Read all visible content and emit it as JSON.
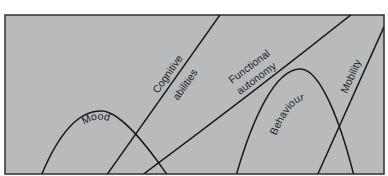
{
  "diagram": {
    "background_color": "#b9babc",
    "line_color": "#1a1a1a",
    "curves": [
      {
        "id": "mood",
        "label": "Mood",
        "shape": "hump"
      },
      {
        "id": "cognitive",
        "label_line1": "Cognitive",
        "label_line2": "abilities",
        "shape": "rising-line"
      },
      {
        "id": "functional",
        "label_line1": "Functional",
        "label_line2": "autonomy",
        "shape": "rising-line"
      },
      {
        "id": "behaviour",
        "label": "Behaviour",
        "shape": "hump"
      },
      {
        "id": "mobility",
        "label": "Mobility",
        "shape": "rising-line"
      }
    ]
  },
  "labels": {
    "mood": "Mood",
    "cognitive": "Cognitive",
    "abilities": "abilities",
    "functional": "Functional",
    "autonomy": "autonomy",
    "behaviour": "Behaviour",
    "mobility": "Mobility"
  }
}
